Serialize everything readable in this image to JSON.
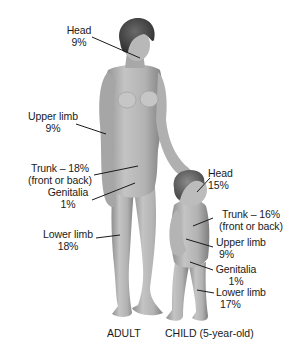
{
  "figure": {
    "adult": {
      "caption": "ADULT",
      "labels": [
        {
          "id": "head",
          "name": "Head",
          "value": "9%"
        },
        {
          "id": "upper_limb",
          "name": "Upper limb",
          "value": "9%"
        },
        {
          "id": "trunk",
          "name": "Trunk – 18%",
          "value": "(front or back)"
        },
        {
          "id": "genitalia",
          "name": "Genitalia",
          "value": "1%"
        },
        {
          "id": "lower_limb",
          "name": "Lower limb",
          "value": "18%"
        }
      ]
    },
    "child": {
      "caption": "CHILD (5-year-old)",
      "labels": [
        {
          "id": "head",
          "name": "Head",
          "value": "15%"
        },
        {
          "id": "trunk",
          "name": "Trunk – 16%",
          "value": "(front or back)"
        },
        {
          "id": "upper_limb",
          "name": "Upper limb",
          "value": "9%"
        },
        {
          "id": "genitalia",
          "name": "Genitalia",
          "value": "1%"
        },
        {
          "id": "lower_limb",
          "name": "Lower limb",
          "value": "17%"
        }
      ]
    },
    "colors": {
      "background": "#ffffff",
      "skin": "#b9b9b9",
      "skin_shadow": "#8c8c8c",
      "hair": "#4a4a4a",
      "leader_line": "#1a1a1a",
      "text": "#1a1a1a"
    }
  }
}
